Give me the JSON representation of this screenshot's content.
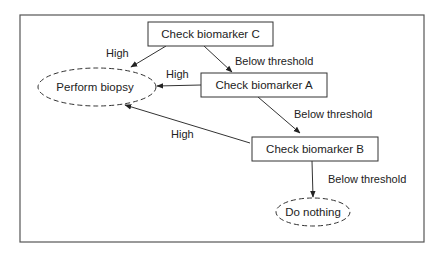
{
  "diagram": {
    "type": "decision-flowchart",
    "colors": {
      "stroke": "#333333",
      "text": "#222222",
      "background": "#ffffff"
    },
    "nodes": [
      {
        "id": "C",
        "shape": "rect",
        "label": "Check biomarker C"
      },
      {
        "id": "A",
        "shape": "rect",
        "label": "Check biomarker A"
      },
      {
        "id": "B",
        "shape": "rect",
        "label": "Check biomarker B"
      },
      {
        "id": "biopsy",
        "shape": "dashed-ellipse",
        "label": "Perform biopsy"
      },
      {
        "id": "nothing",
        "shape": "dashed-ellipse",
        "label": "Do nothing"
      }
    ],
    "edges": [
      {
        "from": "C",
        "to": "biopsy",
        "label": "High"
      },
      {
        "from": "C",
        "to": "A",
        "label": "Below threshold"
      },
      {
        "from": "A",
        "to": "biopsy",
        "label": "High"
      },
      {
        "from": "A",
        "to": "B",
        "label": "Below threshold"
      },
      {
        "from": "B",
        "to": "biopsy",
        "label": "High"
      },
      {
        "from": "B",
        "to": "nothing",
        "label": "Below threshold"
      }
    ]
  }
}
